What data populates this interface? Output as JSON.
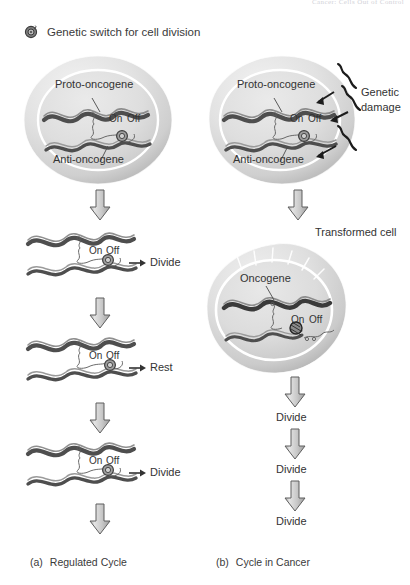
{
  "page": {
    "running_head": "Cancer: Cells Out of Control",
    "width": 410,
    "height": 585
  },
  "legend": {
    "icon": "genetic-switch-icon",
    "label": "Genetic switch for cell division"
  },
  "colors": {
    "cell_fill_light": "#ededed",
    "cell_fill_mid": "#d8d8d8",
    "cell_fill_dark": "#bdbdbd",
    "membrane": "#ffffff",
    "gene_dark": "#4a4a4a",
    "gene_light": "#a8a8a8",
    "arrow_fill": "#c9c9c9",
    "arrow_stroke": "#555555",
    "text": "#333333",
    "running_head": "#d2d2d8"
  },
  "panel_a": {
    "caption_index": "(a)",
    "caption_text": "Regulated Cycle",
    "cell": {
      "name": "normal-cell",
      "labels": {
        "proto_oncogene": "Proto-oncogene",
        "anti_oncogene": "Anti-oncogene",
        "switch_on": "On",
        "switch_off": "Off"
      }
    },
    "steps": [
      {
        "id": "step-1",
        "switch_on": "On",
        "switch_off": "Off",
        "switch_state": "on",
        "outcome": "Divide"
      },
      {
        "id": "step-2",
        "switch_on": "On",
        "switch_off": "Off",
        "switch_state": "off",
        "outcome": "Rest"
      },
      {
        "id": "step-3",
        "switch_on": "On",
        "switch_off": "Off",
        "switch_state": "on",
        "outcome": "Divide"
      }
    ]
  },
  "panel_b": {
    "caption_index": "(b)",
    "caption_text": "Cycle in Cancer",
    "cell": {
      "name": "damaged-cell",
      "labels": {
        "proto_oncogene": "Proto-oncogene",
        "anti_oncogene": "Anti-oncogene",
        "switch_on": "On",
        "switch_off": "Off",
        "genetic_damage": "Genetic\ndamage",
        "genetic_damage_line1": "Genetic",
        "genetic_damage_line2": "damage"
      }
    },
    "transformed_cell": {
      "name": "transformed-cell",
      "title": "Transformed cell",
      "labels": {
        "oncogene": "Oncogene",
        "switch_on": "On",
        "switch_off": "Off"
      }
    },
    "divisions": [
      {
        "id": "divide-1",
        "label": "Divide"
      },
      {
        "id": "divide-2",
        "label": "Divide"
      },
      {
        "id": "divide-3",
        "label": "Divide"
      }
    ]
  }
}
